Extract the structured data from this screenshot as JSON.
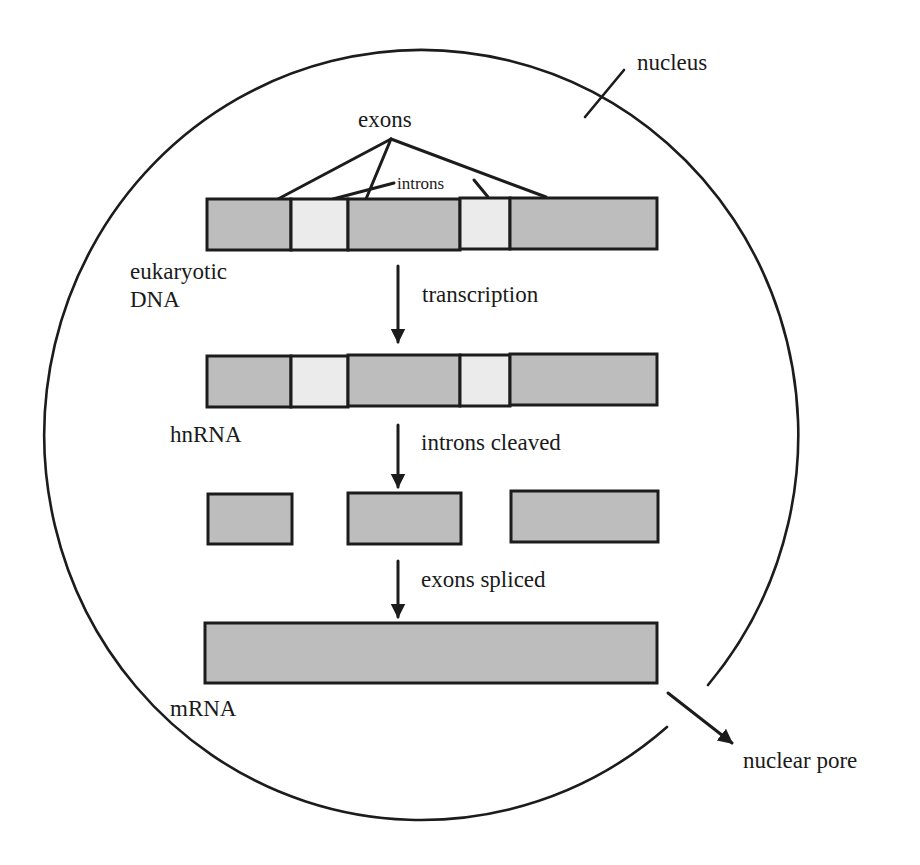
{
  "diagram": {
    "colors": {
      "exon_fill": "#bdbdbd",
      "intron_fill": "#ebebeb",
      "stroke": "#1c1c1c",
      "background": "#ffffff"
    },
    "labels": {
      "nucleus": "nucleus",
      "exons": "exons",
      "introns": "introns",
      "dna_line1": "eukaryotic",
      "dna_line2": "DNA",
      "transcription": "transcription",
      "hnrna": "hnRNA",
      "introns_cleaved": "introns cleaved",
      "exons_spliced": "exons spliced",
      "mrna": "mRNA",
      "nuclear_pore": "nuclear pore"
    },
    "rows": [
      {
        "name": "eukaryotic DNA",
        "segments": [
          "exon",
          "intron",
          "exon",
          "intron",
          "exon"
        ]
      },
      {
        "name": "hnRNA",
        "segments": [
          "exon",
          "intron",
          "exon",
          "intron",
          "exon"
        ]
      },
      {
        "name": "cleaved exons",
        "segments": [
          "exon",
          "exon",
          "exon"
        ]
      },
      {
        "name": "mRNA",
        "segments": [
          "exon"
        ]
      }
    ],
    "steps": [
      "transcription",
      "introns cleaved",
      "exons spliced"
    ]
  }
}
